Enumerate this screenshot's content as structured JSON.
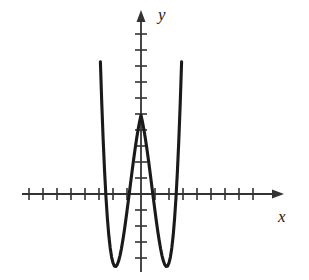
{
  "figure": {
    "title": "",
    "background_color": "#ffffff",
    "stroke_color": "#1a1a1a",
    "axis_color": "#333333",
    "x_axis_label": "x",
    "y_axis_label": "y",
    "x_axis_name": "x-axis",
    "y_axis_name": "y-axis",
    "x_arrow_name": "x-axis-arrowhead",
    "y_arrow_name": "y-axis-arrowhead"
  },
  "chart_data": {
    "type": "line",
    "title": "",
    "xlabel": "x",
    "ylabel": "y",
    "xlim": [
      -8.5,
      8.5
    ],
    "ylim": [
      -5.5,
      10.5
    ],
    "grid": false,
    "legend": false,
    "legend_position": "none",
    "x_ticks": [
      -8,
      -7,
      -6,
      -5,
      -4,
      -3,
      -2,
      -1,
      1,
      2,
      3,
      4,
      5,
      6,
      7,
      8
    ],
    "y_ticks": [
      -4,
      -3,
      -2,
      -1,
      1,
      2,
      3,
      4,
      5,
      6,
      7,
      8
    ],
    "tick_labels_shown": false,
    "x_intercepts": [
      -2.7,
      -1.35,
      1.35,
      2.7
    ],
    "local_maximum": {
      "x": 0,
      "y": 7
    },
    "local_minima": [
      {
        "x": -2.1,
        "y": -1.4
      },
      {
        "x": 2.1,
        "y": -1.4
      }
    ],
    "series": [
      {
        "name": "curve",
        "x": [
          -3.3,
          -3.2,
          -3.1,
          -3.0,
          -2.9,
          -2.8,
          -2.7,
          -2.6,
          -2.5,
          -2.4,
          -2.3,
          -2.2,
          -2.1,
          -2.0,
          -1.9,
          -1.8,
          -1.7,
          -1.6,
          -1.5,
          -1.4,
          -1.3,
          -1.2,
          -1.1,
          -1.0,
          -0.9,
          -0.8,
          -0.7,
          -0.6,
          -0.5,
          -0.4,
          -0.3,
          -0.2,
          -0.1,
          0.0,
          0.1,
          0.2,
          0.3,
          0.4,
          0.5,
          0.6,
          0.7,
          0.8,
          0.9,
          1.0,
          1.1,
          1.2,
          1.3,
          1.4,
          1.5,
          1.6,
          1.7,
          1.8,
          1.9,
          2.0,
          2.1,
          2.2,
          2.3,
          2.4,
          2.5,
          2.6,
          2.7,
          2.8,
          2.9,
          3.0,
          3.1,
          3.2,
          3.3
        ],
        "y": [
          22.96,
          18.62,
          14.74,
          11.3,
          8.26,
          5.62,
          3.34,
          1.4,
          -0.22,
          -1.53,
          -2.58,
          -3.37,
          -3.94,
          -4.31,
          -4.5,
          -4.53,
          -4.42,
          -4.19,
          -3.85,
          -3.42,
          -2.91,
          -2.34,
          -1.72,
          -1.06,
          -0.38,
          0.3,
          0.99,
          1.67,
          2.33,
          2.95,
          3.53,
          4.06,
          4.53,
          4.93,
          4.53,
          4.06,
          3.53,
          2.95,
          2.33,
          1.67,
          0.99,
          0.3,
          -0.38,
          -1.06,
          -1.72,
          -2.34,
          -2.91,
          -3.42,
          -3.85,
          -4.19,
          -4.42,
          -4.53,
          -4.5,
          -4.31,
          -3.94,
          -3.37,
          -2.58,
          -1.53,
          -0.22,
          1.4,
          3.34,
          5.62,
          8.26,
          11.3,
          14.74,
          18.62,
          22.96
        ]
      }
    ]
  }
}
